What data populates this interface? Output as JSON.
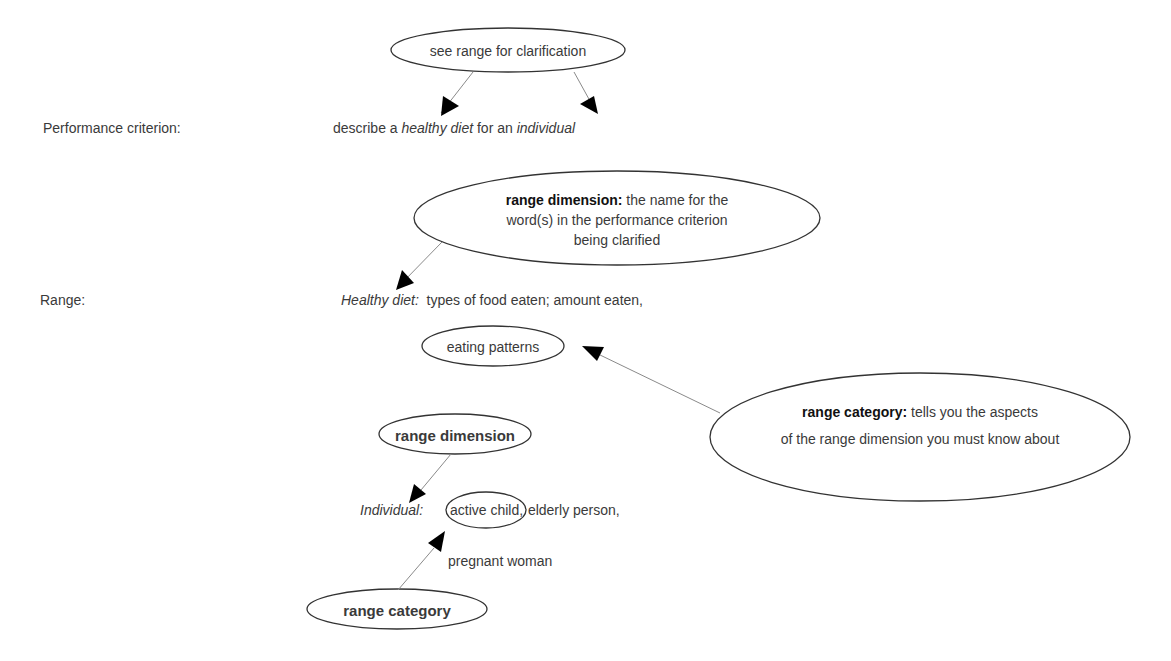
{
  "labels": {
    "performance_criterion": "Performance criterion:",
    "range": "Range:"
  },
  "criterion": {
    "prefix": "describe a ",
    "term1": "healthy diet",
    "middle": " for an ",
    "term2": "individual"
  },
  "bubbles": {
    "see_range": "see range for clarification",
    "range_dimension_def": {
      "bold": "range dimension:",
      "line1_rest": " the name for the",
      "line2": "word(s) in the performance criterion",
      "line3": "being clarified"
    },
    "eating_patterns": "eating patterns",
    "range_category_def": {
      "bold": "range category:",
      "line1_rest": " tells you the aspects",
      "line2": "of the range dimension you must know about"
    },
    "range_dimension_label": "range dimension",
    "range_category_label": "range category",
    "active_child": "active child,"
  },
  "range_items": {
    "healthy_diet": {
      "label": "Healthy diet:",
      "values": "  types of food eaten; amount eaten,"
    },
    "individual": {
      "label": "Individual:",
      "after_circle": " elderly person,",
      "line2": "pregnant woman"
    }
  },
  "colors": {
    "text": "#3a3a3a",
    "bold_text": "#111111",
    "outline": "#333333",
    "connector": "#8a8a8a",
    "arrowhead": "#000000",
    "background": "#ffffff"
  }
}
